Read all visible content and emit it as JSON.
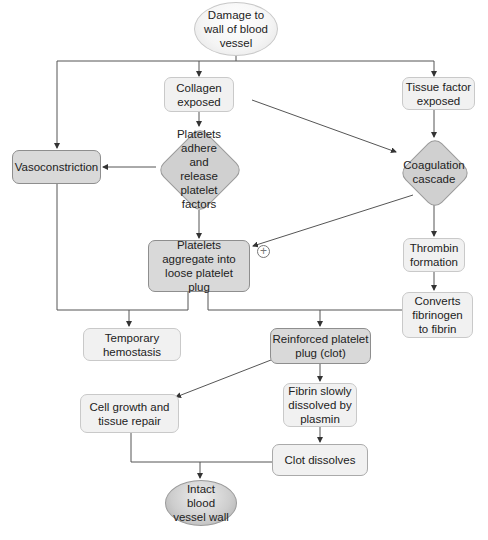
{
  "diagram": {
    "nodes": {
      "damage": "Damage to wall of blood vessel",
      "collagen": "Collagen exposed",
      "tissue_factor": "Tissue factor exposed",
      "vasoconstriction": "Vasoconstriction",
      "platelets_adhere": "Platelets adhere and release platelet factors",
      "coagulation": "Coagulation cascade",
      "aggregate": "Platelets aggregate into loose platelet plug",
      "thrombin": "Thrombin formation",
      "converts": "Converts fibrinogen to fibrin",
      "temporary": "Temporary hemostasis",
      "reinforced": "Reinforced platelet plug (clot)",
      "cell_growth": "Cell growth and tissue repair",
      "fibrin_dissolved": "Fibrin slowly dissolved by plasmin",
      "clot_dissolves": "Clot dissolves",
      "intact": "Intact blood vessel wall"
    },
    "positive_feedback_symbol": "+",
    "edges": [
      {
        "from": "damage",
        "to": "vasoconstriction"
      },
      {
        "from": "damage",
        "to": "collagen"
      },
      {
        "from": "damage",
        "to": "tissue_factor"
      },
      {
        "from": "collagen",
        "to": "platelets_adhere"
      },
      {
        "from": "collagen",
        "to": "coagulation"
      },
      {
        "from": "tissue_factor",
        "to": "coagulation"
      },
      {
        "from": "platelets_adhere",
        "to": "vasoconstriction"
      },
      {
        "from": "platelets_adhere",
        "to": "aggregate"
      },
      {
        "from": "coagulation",
        "to": "aggregate",
        "label": "+"
      },
      {
        "from": "coagulation",
        "to": "thrombin"
      },
      {
        "from": "thrombin",
        "to": "converts"
      },
      {
        "from": "vasoconstriction",
        "to": "temporary"
      },
      {
        "from": "aggregate",
        "to": "temporary"
      },
      {
        "from": "aggregate",
        "to": "reinforced"
      },
      {
        "from": "converts",
        "to": "reinforced"
      },
      {
        "from": "reinforced",
        "to": "cell_growth"
      },
      {
        "from": "reinforced",
        "to": "fibrin_dissolved"
      },
      {
        "from": "fibrin_dissolved",
        "to": "clot_dissolves"
      },
      {
        "from": "cell_growth",
        "to": "intact"
      },
      {
        "from": "clot_dissolves",
        "to": "intact"
      }
    ]
  }
}
